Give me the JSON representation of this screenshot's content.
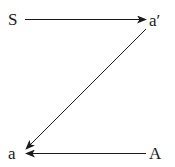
{
  "diagram": {
    "nodes": [
      {
        "id": "S",
        "label": "S"
      },
      {
        "id": "a_prime",
        "label": "a′"
      },
      {
        "id": "a",
        "label": "a"
      },
      {
        "id": "A",
        "label": "A"
      }
    ],
    "edges": [
      {
        "from": "S",
        "to": "a_prime"
      },
      {
        "from": "a_prime",
        "to": "a"
      },
      {
        "from": "A",
        "to": "a"
      }
    ]
  }
}
